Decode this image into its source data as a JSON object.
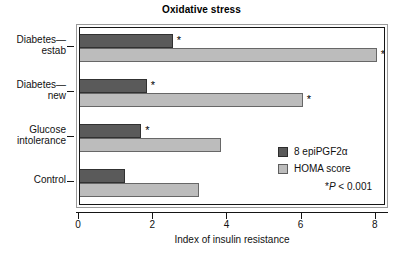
{
  "chart_data": {
    "type": "bar",
    "orientation": "horizontal",
    "title": "Oxidative stress",
    "xlabel": "Index of insulin resistance",
    "ylabel": "",
    "xlim": [
      0,
      8.3
    ],
    "xticks": [
      0,
      2,
      4,
      6,
      8
    ],
    "xtick_labels": [
      "0",
      "2",
      "4",
      "6",
      "8"
    ],
    "grid": false,
    "legend_position": "inside-right",
    "categories": [
      "Diabetes—estab",
      "Diabetes—new",
      "Glucose intolerance",
      "Control"
    ],
    "category_label_lines": [
      [
        "Diabetes—",
        "estab"
      ],
      [
        "Diabetes—",
        "new"
      ],
      [
        "Glucose",
        "intolerance"
      ],
      [
        "Control"
      ]
    ],
    "series": [
      {
        "name": "8 epiPGF2α",
        "color": "#5a5a5a",
        "values": [
          2.5,
          1.8,
          1.65,
          1.2
        ],
        "significant": [
          true,
          true,
          true,
          false
        ]
      },
      {
        "name": "HOMA score",
        "color": "#bcbcbc",
        "values": [
          8.0,
          6.0,
          3.8,
          3.2
        ],
        "significant": [
          true,
          true,
          false,
          false
        ]
      }
    ],
    "significance_marker": "*",
    "annotations": [
      {
        "text": "*P < 0.001",
        "position": "bottom-right"
      }
    ]
  },
  "legend": {
    "items": [
      {
        "label": "8 epiPGF2α",
        "swatch": "dark"
      },
      {
        "label": "HOMA score",
        "swatch": "light"
      }
    ]
  },
  "footnote": {
    "star": "*",
    "p_italic": "P",
    "rest": " < 0.001"
  },
  "colors": {
    "series_dark": "#5a5a5a",
    "series_light": "#bcbcbc",
    "axis": "#151515",
    "frame_outer": "#9a9a9a",
    "text": "#111111"
  }
}
